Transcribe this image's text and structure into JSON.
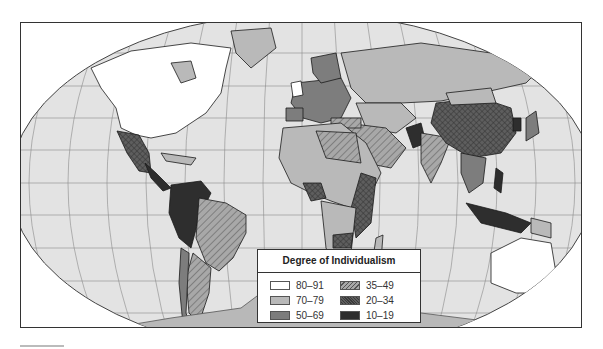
{
  "map": {
    "title": "Degree of Individualism",
    "projection": "world-robinson",
    "colors": {
      "ocean": "#e3e3e3",
      "graticule": "#8a8a8a",
      "border": "#1a1a1a",
      "antarctica": "#b8b8b8"
    }
  },
  "legend": {
    "title": "Degree of Individualism",
    "items": [
      {
        "label": "80–91",
        "fill": "#ffffff",
        "pattern": "solid"
      },
      {
        "label": "35–49",
        "fill": "#a8a8a8",
        "pattern": "hatch"
      },
      {
        "label": "70–79",
        "fill": "#b9b9b9",
        "pattern": "solid"
      },
      {
        "label": "20–34",
        "fill": "#5e5e5e",
        "pattern": "crosshatch"
      },
      {
        "label": "50–69",
        "fill": "#7d7d7d",
        "pattern": "solid"
      },
      {
        "label": "10–19",
        "fill": "#2e2e2e",
        "pattern": "solid"
      }
    ]
  }
}
